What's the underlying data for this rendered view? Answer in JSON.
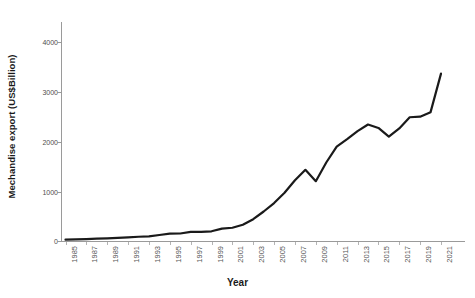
{
  "chart_data": {
    "type": "line",
    "title": "",
    "subtitle": "",
    "xlabel": "Year",
    "ylabel": "Mechandise export (US$Billion)",
    "xlim": [
      1985,
      2021
    ],
    "ylim": [
      0,
      4400
    ],
    "yticks": [
      0,
      1000,
      2000,
      3000,
      4000
    ],
    "ytick_labels": [
      "0",
      "1000",
      "2000",
      "3000",
      "4000"
    ],
    "xticks": [
      1985,
      1987,
      1989,
      1991,
      1993,
      1995,
      1997,
      1999,
      2001,
      2003,
      2005,
      2007,
      2009,
      2011,
      2013,
      2015,
      2017,
      2019,
      2021
    ],
    "xtick_labels": [
      "1985",
      "1987",
      "1989",
      "1991",
      "1993",
      "1995",
      "1997",
      "1999",
      "2001",
      "2003",
      "2005",
      "2007",
      "2009",
      "2011",
      "2013",
      "2015",
      "2017",
      "2019",
      "2021"
    ],
    "grid": false,
    "legend": false,
    "legend_position": "none",
    "line_color": "#1a1a1a",
    "line_width": 2.2,
    "axis_color": "#9a9a9a",
    "background_color": "#ffffff",
    "x": [
      1985,
      1986,
      1987,
      1988,
      1989,
      1990,
      1991,
      1992,
      1993,
      1994,
      1995,
      1996,
      1997,
      1998,
      1999,
      2000,
      2001,
      2002,
      2003,
      2004,
      2005,
      2006,
      2007,
      2008,
      2009,
      2010,
      2011,
      2012,
      2013,
      2014,
      2015,
      2016,
      2017,
      2018,
      2019,
      2020,
      2021
    ],
    "series": [
      {
        "name": "Merchandise export",
        "values": [
          27,
          31,
          39,
          48,
          53,
          62,
          72,
          85,
          92,
          121,
          149,
          151,
          183,
          184,
          195,
          249,
          266,
          326,
          438,
          593,
          762,
          969,
          1220,
          1431,
          1202,
          1578,
          1898,
          2049,
          2209,
          2342,
          2273,
          2098,
          2263,
          2487,
          2499,
          2590,
          3364
        ]
      }
    ]
  },
  "axis_titles": {
    "y": "Mechandise export (US$Billion)",
    "x": "Year"
  }
}
